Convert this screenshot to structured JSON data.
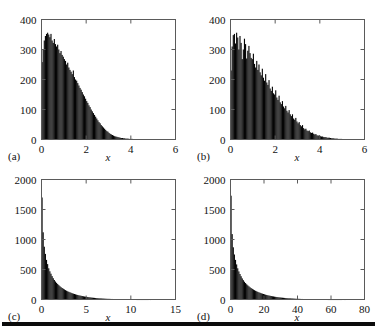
{
  "figure": {
    "title": "",
    "panel_count": 4,
    "bottom_rule": true
  },
  "panels": [
    {
      "letter": "(a)",
      "xlabel": "x",
      "ylabel": "",
      "xticks": [
        "0",
        "2",
        "4",
        "6"
      ],
      "yticks": [
        "0",
        "100",
        "200",
        "300",
        "400"
      ]
    },
    {
      "letter": "(b)",
      "xlabel": "x",
      "ylabel": "",
      "xticks": [
        "0",
        "2",
        "4",
        "6"
      ],
      "yticks": [
        "0",
        "100",
        "200",
        "300",
        "400"
      ]
    },
    {
      "letter": "(c)",
      "xlabel": "x",
      "ylabel": "",
      "xticks": [
        "0",
        "5",
        "10",
        "15"
      ],
      "yticks": [
        "0",
        "500",
        "1000",
        "1500",
        "2000"
      ]
    },
    {
      "letter": "(d)",
      "xlabel": "x",
      "ylabel": "",
      "xticks": [
        "0",
        "20",
        "40",
        "60",
        "80"
      ],
      "yticks": [
        "0",
        "500",
        "1000",
        "1500",
        "2000"
      ]
    }
  ],
  "chart_data": [
    {
      "type": "bar",
      "panel": "(a)",
      "title": "",
      "xlabel": "x",
      "ylabel": "",
      "xlim": [
        0,
        6
      ],
      "ylim": [
        0,
        400
      ],
      "xticks": [
        0,
        2,
        4,
        6
      ],
      "yticks": [
        0,
        100,
        200,
        300,
        400
      ],
      "grid": false,
      "legend": false,
      "bin_width": 0.05,
      "x": [
        0.025,
        0.075,
        0.125,
        0.175,
        0.225,
        0.275,
        0.325,
        0.375,
        0.425,
        0.475,
        0.525,
        0.575,
        0.625,
        0.675,
        0.725,
        0.775,
        0.825,
        0.875,
        0.925,
        0.975,
        1.025,
        1.075,
        1.125,
        1.175,
        1.225,
        1.275,
        1.325,
        1.375,
        1.425,
        1.475,
        1.525,
        1.575,
        1.625,
        1.675,
        1.725,
        1.775,
        1.825,
        1.875,
        1.925,
        1.975,
        2.025,
        2.075,
        2.125,
        2.175,
        2.225,
        2.275,
        2.325,
        2.375,
        2.425,
        2.475,
        2.525,
        2.575,
        2.625,
        2.675,
        2.725,
        2.775,
        2.825,
        2.875,
        2.925,
        2.975,
        3.025,
        3.075,
        3.125,
        3.175,
        3.225,
        3.275,
        3.325,
        3.375,
        3.425,
        3.475,
        3.525,
        3.575,
        3.625,
        3.675,
        3.725,
        3.775,
        3.825,
        3.875,
        3.925,
        3.975,
        4.025,
        4.075,
        4.125,
        4.175,
        4.225,
        4.275,
        4.325,
        4.375,
        4.425,
        4.475,
        4.525,
        4.575,
        4.625,
        4.675,
        4.725,
        4.775,
        4.825,
        4.875,
        4.925,
        4.975,
        5.025,
        5.075,
        5.125,
        5.175,
        5.225,
        5.275,
        5.325,
        5.375,
        5.425,
        5.475,
        5.525,
        5.575,
        5.625,
        5.675,
        5.725,
        5.775,
        5.825,
        5.875,
        5.925,
        5.975
      ],
      "values": [
        258,
        300,
        330,
        345,
        352,
        356,
        350,
        341,
        352,
        330,
        322,
        335,
        318,
        310,
        316,
        300,
        288,
        295,
        282,
        276,
        268,
        262,
        250,
        256,
        240,
        232,
        226,
        218,
        230,
        208,
        200,
        196,
        188,
        180,
        172,
        166,
        158,
        150,
        144,
        136,
        128,
        122,
        114,
        108,
        100,
        94,
        88,
        82,
        76,
        70,
        64,
        58,
        54,
        48,
        44,
        40,
        36,
        32,
        28,
        26,
        22,
        19,
        17,
        15,
        13,
        11,
        10,
        9,
        8,
        7,
        6,
        5,
        5,
        4,
        4,
        3,
        3,
        3,
        2,
        2,
        2,
        2,
        1,
        1,
        1,
        1,
        1,
        1,
        0,
        1,
        0,
        0,
        0,
        0,
        0,
        0,
        0,
        0,
        0,
        0,
        0,
        0,
        0,
        0,
        0,
        0,
        0,
        0,
        0,
        0,
        0,
        0,
        0,
        0,
        0,
        0,
        0,
        0,
        0,
        0
      ]
    },
    {
      "type": "bar",
      "panel": "(b)",
      "title": "",
      "xlabel": "x",
      "ylabel": "",
      "xlim": [
        0,
        6
      ],
      "ylim": [
        0,
        400
      ],
      "xticks": [
        0,
        2,
        4,
        6
      ],
      "yticks": [
        0,
        100,
        200,
        300,
        400
      ],
      "grid": false,
      "legend": false,
      "bin_width": 0.05,
      "x": [
        0.025,
        0.075,
        0.125,
        0.175,
        0.225,
        0.275,
        0.325,
        0.375,
        0.425,
        0.475,
        0.525,
        0.575,
        0.625,
        0.675,
        0.725,
        0.775,
        0.825,
        0.875,
        0.925,
        0.975,
        1.025,
        1.075,
        1.125,
        1.175,
        1.225,
        1.275,
        1.325,
        1.375,
        1.425,
        1.475,
        1.525,
        1.575,
        1.625,
        1.675,
        1.725,
        1.775,
        1.825,
        1.875,
        1.925,
        1.975,
        2.025,
        2.075,
        2.125,
        2.175,
        2.225,
        2.275,
        2.325,
        2.375,
        2.425,
        2.475,
        2.525,
        2.575,
        2.625,
        2.675,
        2.725,
        2.775,
        2.825,
        2.875,
        2.925,
        2.975,
        3.025,
        3.075,
        3.125,
        3.175,
        3.225,
        3.275,
        3.325,
        3.375,
        3.425,
        3.475,
        3.525,
        3.575,
        3.625,
        3.675,
        3.725,
        3.775,
        3.825,
        3.875,
        3.925,
        3.975,
        4.025,
        4.075,
        4.125,
        4.175,
        4.225,
        4.275,
        4.325,
        4.375,
        4.425,
        4.475,
        4.525,
        4.575,
        4.625,
        4.675,
        4.725,
        4.775,
        4.825,
        4.875,
        4.925,
        4.975,
        5.025,
        5.075,
        5.125,
        5.175,
        5.225,
        5.275,
        5.325,
        5.375,
        5.425,
        5.475,
        5.525,
        5.575,
        5.625,
        5.675,
        5.725,
        5.775,
        5.825,
        5.875,
        5.925,
        5.975
      ],
      "values": [
        230,
        310,
        348,
        352,
        320,
        356,
        340,
        300,
        345,
        322,
        268,
        300,
        336,
        318,
        270,
        296,
        312,
        288,
        272,
        268,
        286,
        252,
        240,
        262,
        232,
        250,
        224,
        214,
        236,
        206,
        196,
        218,
        190,
        182,
        198,
        170,
        162,
        176,
        154,
        150,
        164,
        140,
        132,
        146,
        124,
        118,
        128,
        110,
        104,
        112,
        96,
        90,
        98,
        84,
        78,
        84,
        70,
        66,
        72,
        60,
        54,
        58,
        48,
        44,
        48,
        38,
        34,
        36,
        30,
        28,
        30,
        24,
        22,
        23,
        19,
        17,
        18,
        14,
        13,
        14,
        11,
        10,
        10,
        8,
        8,
        8,
        6,
        6,
        6,
        5,
        4,
        4,
        4,
        3,
        3,
        3,
        2,
        2,
        2,
        2,
        1,
        1,
        1,
        1,
        1,
        1,
        0,
        0,
        0,
        0,
        0,
        0,
        0,
        0,
        0,
        0,
        0,
        0,
        0,
        0
      ]
    },
    {
      "type": "bar",
      "panel": "(c)",
      "title": "",
      "xlabel": "x",
      "ylabel": "",
      "xlim": [
        0,
        15
      ],
      "ylim": [
        0,
        2000
      ],
      "xticks": [
        0,
        5,
        10,
        15
      ],
      "yticks": [
        0,
        500,
        1000,
        1500,
        2000
      ],
      "grid": false,
      "legend": false,
      "bin_width": 0.125,
      "x": [
        0.0625,
        0.1875,
        0.3125,
        0.4375,
        0.5625,
        0.6875,
        0.8125,
        0.9375,
        1.0625,
        1.1875,
        1.3125,
        1.4375,
        1.5625,
        1.6875,
        1.8125,
        1.9375,
        2.0625,
        2.1875,
        2.3125,
        2.4375,
        2.5625,
        2.6875,
        2.8125,
        2.9375,
        3.0625,
        3.1875,
        3.3125,
        3.4375,
        3.5625,
        3.6875,
        3.8125,
        3.9375,
        4.0625,
        4.1875,
        4.3125,
        4.4375,
        4.5625,
        4.6875,
        4.8125,
        4.9375,
        5.0625,
        5.1875,
        5.3125,
        5.4375,
        5.5625,
        5.6875,
        5.8125,
        5.9375,
        6.0625,
        6.1875,
        6.3125,
        6.4375,
        6.5625,
        6.6875,
        6.8125,
        6.9375,
        7.0625,
        7.1875,
        7.3125,
        7.4375,
        7.5625,
        7.6875,
        7.8125,
        7.9375,
        8.0625,
        8.1875,
        8.3125,
        8.4375,
        8.5625,
        8.6875,
        8.8125,
        8.9375,
        9.0625,
        9.1875,
        9.3125,
        9.4375,
        9.5625,
        9.6875,
        9.8125,
        9.9375,
        10.0625,
        10.1875,
        10.3125,
        10.4375,
        10.5625,
        10.6875,
        10.8125,
        10.9375,
        11.0625,
        11.1875,
        11.3125,
        11.4375,
        11.5625,
        11.6875,
        11.8125,
        11.9375,
        12.0625,
        12.1875,
        12.3125,
        12.4375,
        12.5625,
        12.6875,
        12.8125,
        12.9375,
        13.0625,
        13.1875,
        13.3125,
        13.4375,
        13.5625,
        13.6875,
        13.8125,
        13.9375,
        14.0625,
        14.1875,
        14.3125,
        14.4375,
        14.5625,
        14.6875,
        14.8125,
        14.9375
      ],
      "values": [
        1700,
        1120,
        880,
        760,
        660,
        590,
        520,
        470,
        430,
        390,
        355,
        325,
        300,
        278,
        258,
        240,
        222,
        206,
        192,
        180,
        168,
        156,
        146,
        136,
        128,
        120,
        112,
        104,
        98,
        92,
        86,
        80,
        75,
        70,
        66,
        62,
        58,
        54,
        50,
        47,
        44,
        41,
        38,
        36,
        33,
        31,
        29,
        27,
        25,
        23,
        22,
        20,
        19,
        18,
        16,
        15,
        14,
        13,
        12,
        11,
        11,
        10,
        9,
        9,
        8,
        7,
        7,
        6,
        6,
        5,
        5,
        5,
        4,
        4,
        4,
        3,
        3,
        3,
        3,
        2,
        2,
        2,
        2,
        2,
        2,
        1,
        1,
        1,
        1,
        1,
        1,
        1,
        1,
        1,
        1,
        1,
        0,
        1,
        0,
        0,
        0,
        0,
        0,
        0,
        0,
        0,
        0,
        0,
        0,
        0,
        0,
        0,
        0,
        0,
        0,
        0,
        0,
        0,
        0,
        0
      ]
    },
    {
      "type": "bar",
      "panel": "(d)",
      "title": "",
      "xlabel": "x",
      "ylabel": "",
      "xlim": [
        0,
        80
      ],
      "ylim": [
        0,
        2000
      ],
      "xticks": [
        0,
        20,
        40,
        60,
        80
      ],
      "yticks": [
        0,
        500,
        1000,
        1500,
        2000
      ],
      "grid": false,
      "legend": false,
      "bin_width": 0.6667,
      "x": [
        0.33,
        1.0,
        1.67,
        2.33,
        3.0,
        3.67,
        4.33,
        5.0,
        5.67,
        6.33,
        7.0,
        7.67,
        8.33,
        9.0,
        9.67,
        10.33,
        11.0,
        11.67,
        12.33,
        13.0,
        13.67,
        14.33,
        15.0,
        15.67,
        16.33,
        17.0,
        17.67,
        18.33,
        19.0,
        19.67,
        20.33,
        21.0,
        21.67,
        22.33,
        23.0,
        23.67,
        24.33,
        25.0,
        25.67,
        26.33,
        27.0,
        27.67,
        28.33,
        29.0,
        29.67,
        30.33,
        31.0,
        31.67,
        32.33,
        33.0,
        33.67,
        34.33,
        35.0,
        35.67,
        36.33,
        37.0,
        37.67,
        38.33,
        39.0,
        39.67,
        40.33,
        41.0,
        41.67,
        42.33,
        43.0,
        43.67,
        44.33,
        45.0,
        45.67,
        46.33,
        47.0,
        47.67,
        48.33,
        49.0,
        49.67,
        50.33,
        51.0,
        51.67,
        52.33,
        53.0,
        53.67,
        54.33,
        55.0,
        55.67,
        56.33,
        57.0,
        57.67,
        58.33,
        59.0,
        59.67,
        60.33,
        61.0,
        61.67,
        62.33,
        63.0,
        63.67,
        64.33,
        65.0,
        65.67,
        66.33,
        67.0,
        67.67,
        68.33,
        69.0,
        69.67,
        70.33,
        71.0,
        71.67,
        72.33,
        73.0,
        73.67,
        74.33,
        75.0,
        75.67,
        76.33,
        77.0,
        77.67,
        78.33,
        79.0,
        79.67
      ],
      "values": [
        1730,
        1090,
        870,
        750,
        660,
        585,
        520,
        468,
        425,
        388,
        352,
        322,
        296,
        274,
        254,
        236,
        220,
        204,
        190,
        178,
        166,
        155,
        145,
        136,
        127,
        119,
        112,
        104,
        98,
        92,
        86,
        80,
        75,
        70,
        66,
        62,
        58,
        54,
        51,
        47,
        44,
        41,
        39,
        36,
        34,
        32,
        30,
        28,
        26,
        24,
        23,
        21,
        20,
        19,
        17,
        16,
        15,
        14,
        13,
        12,
        12,
        11,
        10,
        9,
        9,
        8,
        8,
        7,
        7,
        6,
        6,
        5,
        5,
        5,
        4,
        4,
        4,
        3,
        3,
        3,
        3,
        2,
        2,
        2,
        2,
        2,
        2,
        1,
        1,
        1,
        1,
        1,
        1,
        1,
        1,
        1,
        1,
        1,
        1,
        1,
        0,
        0,
        1,
        0,
        0,
        0,
        0,
        0,
        0,
        0,
        0,
        0,
        0,
        0,
        0,
        0,
        0,
        0,
        0,
        0
      ]
    }
  ]
}
